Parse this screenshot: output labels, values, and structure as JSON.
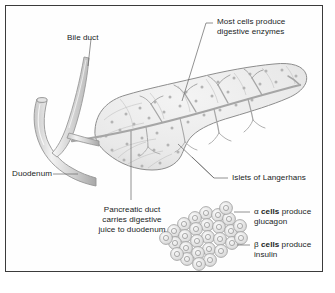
{
  "figure": {
    "background_color": "#ffffff",
    "border_color": "#3b3b3b",
    "organ_fill": "#eeeeee",
    "organ_stroke": "#8d8d8d",
    "duct_color": "#a6a6a6",
    "leader_color": "#6e6e6e",
    "text_color": "#201d1d"
  },
  "labels": {
    "bile_duct": "Bile duct",
    "most_cells_line1": "Most cells produce",
    "most_cells_line2": "digestive enzymes",
    "duodenum": "Duodenum",
    "islets": "Islets of Langerhans",
    "pancreatic_duct_line1": "Pancreatic duct",
    "pancreatic_duct_line2": "carries digestive",
    "pancreatic_duct_line3": "juice to duodenum",
    "alpha_symbol": "α",
    "alpha_bold": "cells",
    "alpha_rest": "produce",
    "alpha_line2": "glucagon",
    "beta_symbol": "β",
    "beta_bold": "cells",
    "beta_rest": "produce",
    "beta_line2": "insulin"
  },
  "structures": {
    "pancreas": "pancreas-body",
    "duodenum": "duodenum-tube",
    "bile_duct": "bile-duct-tube",
    "pancreatic_duct": "pancreatic-duct-branching",
    "islet_cluster": "islet-of-langerhans-cell-cluster",
    "islet_cell_count": 28
  }
}
